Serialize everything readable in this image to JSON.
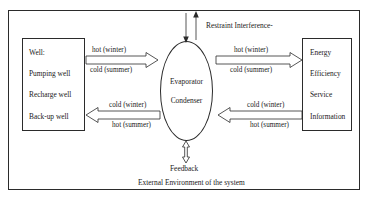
{
  "diagram": {
    "caption": "External Environment of the system",
    "top_annotation": "Restraint Interference-",
    "feedback_label": "Feedback",
    "source_node": {
      "title": "Well:",
      "items": [
        "Pumping well",
        "Recharge well",
        "Back-up well"
      ]
    },
    "center_node": {
      "line1": "Evaporator",
      "line2": "Condenser"
    },
    "target_node": {
      "items": [
        "Energy",
        "Efficiency",
        "Service",
        "Information"
      ]
    },
    "flows": {
      "well_to_unit_top": {
        "above": "hot (winter)",
        "below": "cold (summer)"
      },
      "unit_to_output_top": {
        "above": "hot (winter)",
        "below": "cold (summer)"
      },
      "unit_to_well_bottom": {
        "above": "cold (winter)",
        "below": "hot (summer)"
      },
      "output_to_unit_bottom": {
        "above": "cold (winter)",
        "below": "hot (summer)"
      }
    },
    "colors": {
      "stroke": "#2b2b2b",
      "fill": "#ffffff",
      "text": "#1a1a1a"
    }
  }
}
